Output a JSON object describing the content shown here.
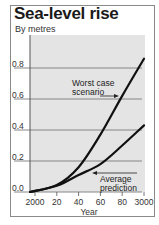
{
  "chart_data": {
    "type": "line",
    "title": "Sea-level rise",
    "subtitle": "By metres",
    "xlabel": "Year",
    "ylabel": "By metres",
    "x": [
      2000,
      2020,
      2040,
      2060,
      2080,
      2100
    ],
    "x_tick_labels": [
      "2000",
      "20",
      "40",
      "60",
      "80",
      "3000"
    ],
    "y_ticks": [
      0.0,
      0.2,
      0.4,
      0.6,
      0.8
    ],
    "y_tick_labels": [
      "0.0",
      "0.2",
      "0.4",
      "0.6",
      "0.8"
    ],
    "ylim": [
      0,
      0.9
    ],
    "grid": "horizontal",
    "legend": "none (inline annotations)",
    "series": [
      {
        "name": "Worst case scenario",
        "values": [
          0.0,
          0.045,
          0.16,
          0.37,
          0.62,
          0.86
        ]
      },
      {
        "name": "Average prediction",
        "values": [
          0.0,
          0.04,
          0.11,
          0.18,
          0.3,
          0.43
        ]
      }
    ],
    "annotations": [
      {
        "text_lines": [
          "Worst case",
          "scenario"
        ],
        "target_series": "Worst case scenario"
      },
      {
        "text_lines": [
          "Average",
          "prediction"
        ],
        "target_series": "Average prediction"
      }
    ]
  },
  "colors": {
    "plot_background": "#e4e4e4",
    "gridline": "#7a7a7a",
    "line": "#111111",
    "frame": "#8a8a8a"
  }
}
